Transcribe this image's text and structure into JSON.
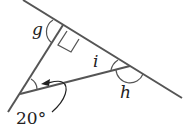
{
  "diagram": {
    "type": "geometry-angles",
    "labels": {
      "g": "g",
      "i": "i",
      "h": "h",
      "given_angle": "20°"
    },
    "right_angle_marker": true,
    "line_color": "#555555",
    "text_color": "#222222"
  }
}
